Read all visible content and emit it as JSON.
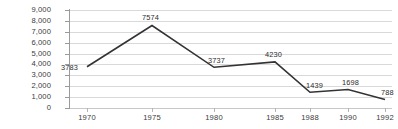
{
  "chart_data": {
    "type": "line",
    "title": "",
    "subtitle": "",
    "xlabel": "",
    "ylabel": "",
    "categories": [
      "1970",
      "1975",
      "1980",
      "1985",
      "1988",
      "1990",
      "1992"
    ],
    "values": [
      3783,
      7574,
      3737,
      4230,
      1439,
      1698,
      788
    ],
    "point_labels": [
      "3783",
      "7574",
      "3737",
      "4230",
      "1439",
      "1698",
      "788"
    ],
    "ylim": [
      0,
      9000
    ],
    "yticks": [
      0,
      1000,
      2000,
      3000,
      4000,
      5000,
      6000,
      7000,
      8000,
      9000
    ],
    "ytick_labels": [
      "9,000",
      "8,000",
      "7,000",
      "6,000",
      "5,000",
      "4,000",
      "3,000",
      "2,000",
      "1,000",
      "0"
    ],
    "grid": true,
    "grid_orientation": "horizontal",
    "legend": null,
    "legend_position": "none",
    "series": [
      {
        "name": "",
        "color": "#333333",
        "values": [
          3783,
          7574,
          3737,
          4230,
          1439,
          1698,
          788
        ]
      }
    ]
  },
  "style": {
    "line_color": "#333333",
    "grid_color": "#d9d9d9",
    "axis_color": "#9a9a9a",
    "text_color": "#3a3a3a",
    "background": "#ffffff"
  }
}
